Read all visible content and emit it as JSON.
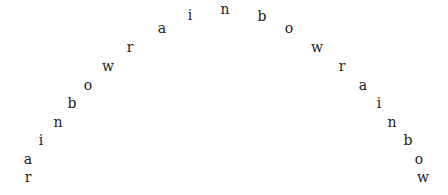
{
  "text": "rainbowrainbowrainbow",
  "text_color": "#222222",
  "background": "#ffffff",
  "letters": [
    {
      "ch": "r",
      "x": 28,
      "y": 181
    },
    {
      "ch": "a",
      "x": 28,
      "y": 163
    },
    {
      "ch": "i",
      "x": 41,
      "y": 144
    },
    {
      "ch": "n",
      "x": 58,
      "y": 126
    },
    {
      "ch": "b",
      "x": 72,
      "y": 107
    },
    {
      "ch": "o",
      "x": 88,
      "y": 89
    },
    {
      "ch": "w",
      "x": 108,
      "y": 70
    },
    {
      "ch": "r",
      "x": 130,
      "y": 51
    },
    {
      "ch": "a",
      "x": 162,
      "y": 32
    },
    {
      "ch": "i",
      "x": 190,
      "y": 19
    },
    {
      "ch": "n",
      "x": 225,
      "y": 13
    },
    {
      "ch": "b",
      "x": 262,
      "y": 20
    },
    {
      "ch": "o",
      "x": 289,
      "y": 32
    },
    {
      "ch": "w",
      "x": 317,
      "y": 51
    },
    {
      "ch": "r",
      "x": 342,
      "y": 70
    },
    {
      "ch": "a",
      "x": 363,
      "y": 89
    },
    {
      "ch": "i",
      "x": 379,
      "y": 107
    },
    {
      "ch": "n",
      "x": 392,
      "y": 126
    },
    {
      "ch": "b",
      "x": 408,
      "y": 144
    },
    {
      "ch": "o",
      "x": 419,
      "y": 163
    },
    {
      "ch": "w",
      "x": 423,
      "y": 181
    }
  ]
}
